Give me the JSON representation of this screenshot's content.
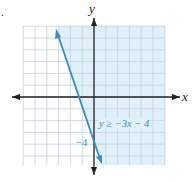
{
  "item_marker": ".",
  "chart_data": {
    "type": "line",
    "title": "",
    "xlabel": "x",
    "ylabel": "y",
    "xlim": [
      -6,
      6
    ],
    "ylim": [
      -6,
      6
    ],
    "grid": true,
    "series": [
      {
        "name": "y ≥ −3x − 4",
        "kind": "boundary-line",
        "style": "solid",
        "slope": -3,
        "intercept": -4,
        "x": [
          -2.1,
          0.6
        ],
        "y": [
          2.3,
          -5.8
        ],
        "shaded_region": "above/right of line",
        "color": "#3a8cc8"
      }
    ],
    "annotations": [
      {
        "text": "y ≥ −3x − 4",
        "x": 0.4,
        "y": -2.5
      },
      {
        "text": "−4",
        "x": -0.9,
        "y": -4
      }
    ]
  },
  "labels": {
    "x_axis": "x",
    "y_axis": "y",
    "inequality": "y ≥ −3x − 4",
    "y_intercept": "−4"
  },
  "colors": {
    "shade": "#dff0f8",
    "grid": "#c3d3dc",
    "axis": "#222222",
    "line": "#3a8cc8",
    "label": "#4a8fbf"
  }
}
